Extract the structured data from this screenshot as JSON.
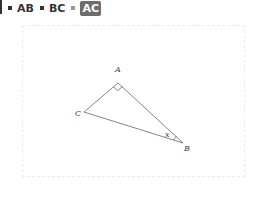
{
  "legend": {
    "items": [
      {
        "label": "AB",
        "active": false
      },
      {
        "label": "BC",
        "active": false
      },
      {
        "label": "AC",
        "active": true
      }
    ]
  },
  "diagram": {
    "points": {
      "A": {
        "label": "A",
        "x": 118,
        "y": 83
      },
      "B": {
        "label": "B",
        "x": 183,
        "y": 143
      },
      "C": {
        "label": "C",
        "x": 84,
        "y": 112
      }
    },
    "angle_label": "x",
    "right_angle_at": "A",
    "stroke_color": "#555555"
  }
}
